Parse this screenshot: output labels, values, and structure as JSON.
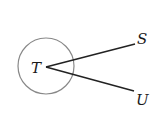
{
  "diagram": {
    "circle": {
      "cx": 46,
      "cy": 66,
      "r": 28,
      "stroke": "#888888"
    },
    "vertex": {
      "x": 46,
      "y": 67
    },
    "rays": [
      {
        "name": "TS",
        "x2": 135,
        "y2": 44
      },
      {
        "name": "TU",
        "x2": 134,
        "y2": 91
      }
    ],
    "labels": {
      "T": "T",
      "S": "S",
      "U": "U"
    },
    "line_color": "#222222"
  }
}
